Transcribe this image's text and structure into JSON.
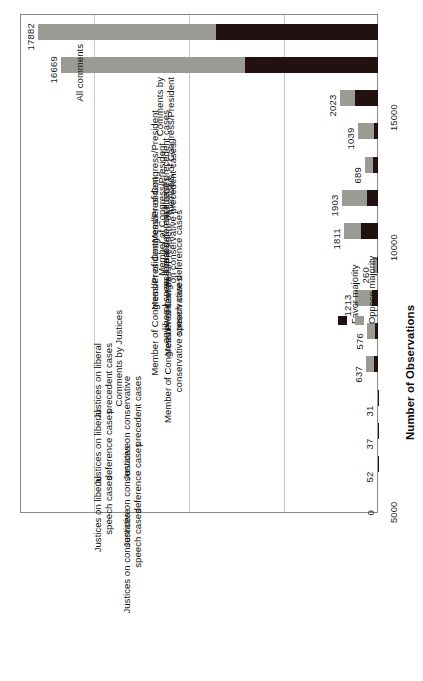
{
  "chart_data": {
    "type": "bar",
    "orientation": "rotated-vertical-bars",
    "stacked": true,
    "title": "",
    "xlabel": "",
    "ylabel": "Number of Observations",
    "axis_title": "Number of Observations",
    "ylim": [
      0,
      18800
    ],
    "grid": true,
    "gridlines": [
      5000,
      10000,
      15000
    ],
    "tick_labels": [
      "5000",
      "10000",
      "15000"
    ],
    "legend_position": "inside-right",
    "legend": [
      {
        "label": "Favor majority",
        "color": "#231112"
      },
      {
        "label": "Oppose majority",
        "color": "#9b9b96"
      }
    ],
    "categories": [
      "All comments",
      "Comments by\nmembers of Congress/President",
      "Member of Congress/President\non liberal precedent cases",
      "Member of Congress/President\non conservative precedent cases",
      "Member of Congress/President\non liberal deference cases",
      "Member of Congress/President on\nconservative deference cases",
      "Member of Congress/President\non liberal speech cases",
      "Member of Congress/President on\nconservative speech cases",
      "Comments by Justices",
      "Justices on liberal\nprecedent cases",
      "Justices on conservative\nprecedent cases",
      "Justices on liberal\ndeference cases",
      "Justices on conservative\ndeference cases",
      "Justices on liberal\nspeech cases",
      "Justices on conservative\nspeech cases"
    ],
    "totals": [
      17882,
      16669,
      2023,
      1039,
      689,
      1903,
      1811,
      260,
      1213,
      576,
      637,
      31,
      37,
      52,
      0
    ],
    "value_labels": [
      "17882",
      "16669",
      "2023",
      "1039",
      "689",
      "1903",
      "1811",
      "260",
      "1213",
      "576",
      "637",
      "31",
      "37",
      "52",
      "0"
    ],
    "series": [
      {
        "name": "Favor majority",
        "color": "#231112",
        "values": [
          8540,
          7000,
          1210,
          200,
          240,
          580,
          900,
          45,
          300,
          145,
          190,
          10,
          12,
          17,
          0
        ]
      },
      {
        "name": "Oppose majority",
        "color": "#9b9b96",
        "values": [
          9342,
          9669,
          813,
          839,
          449,
          1323,
          911,
          215,
          913,
          431,
          447,
          21,
          25,
          35,
          0
        ]
      }
    ]
  },
  "legend_block": {
    "favor_label": "Favor majority",
    "oppose_label": "Oppose majority"
  }
}
